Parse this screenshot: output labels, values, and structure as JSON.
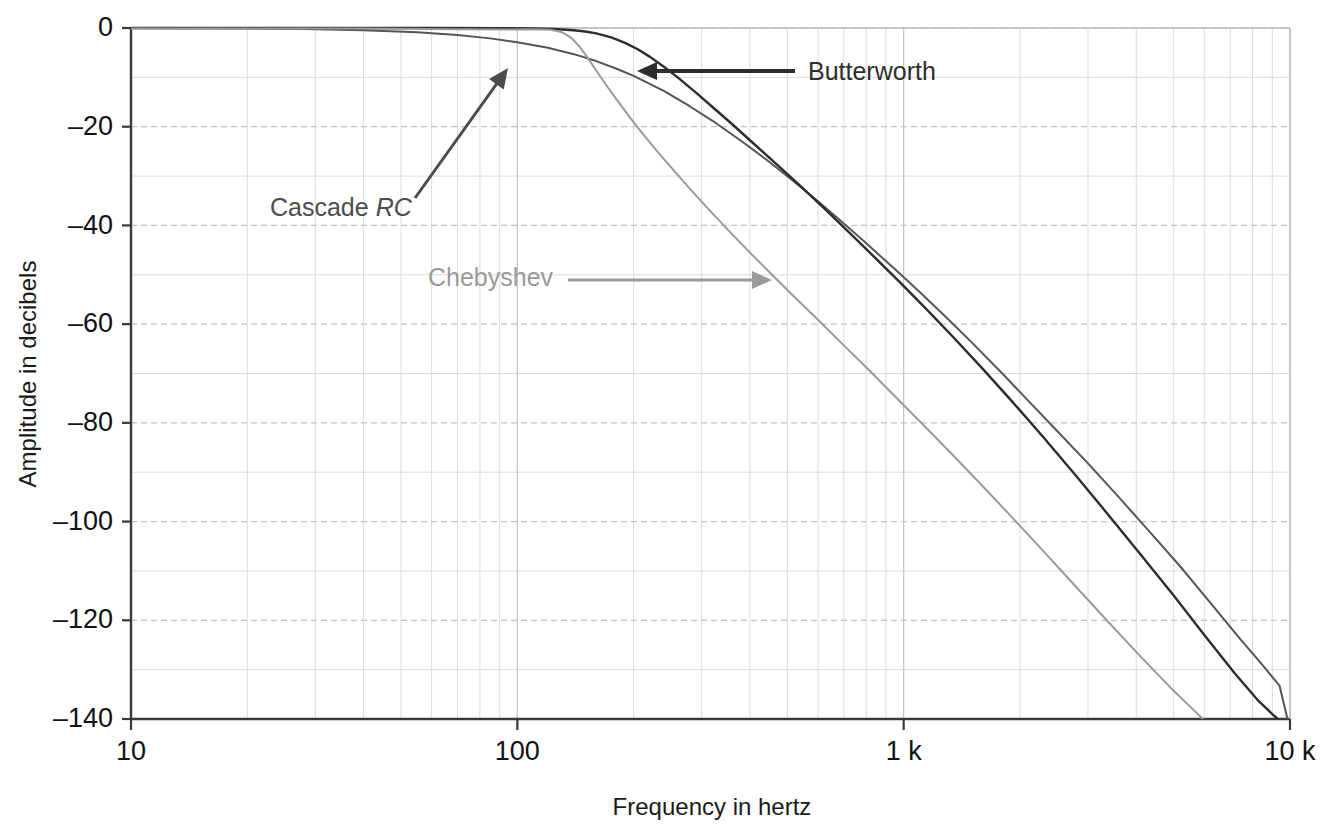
{
  "chart_data": {
    "type": "line",
    "title": "",
    "xlabel": "Frequency in hertz",
    "ylabel": "Amplitude in decibels",
    "xscale": "log",
    "yscale": "linear",
    "xlim": [
      10,
      10000
    ],
    "ylim": [
      -140,
      0
    ],
    "grid": true,
    "grid_minor": true,
    "legend_position": "inline-annotations",
    "x_ticks": [
      {
        "value": 10,
        "label": "10"
      },
      {
        "value": 100,
        "label": "100"
      },
      {
        "value": 1000,
        "label": "1 k"
      },
      {
        "value": 10000,
        "label": "10 k"
      }
    ],
    "y_ticks": [
      {
        "value": 0,
        "label": "0"
      },
      {
        "value": -20,
        "label": "–20"
      },
      {
        "value": -40,
        "label": "–40"
      },
      {
        "value": -60,
        "label": "–60"
      },
      {
        "value": -80,
        "label": "–80"
      },
      {
        "value": -100,
        "label": "–100"
      },
      {
        "value": -120,
        "label": "–120"
      },
      {
        "value": -140,
        "label": "–140"
      }
    ],
    "series": [
      {
        "name": "Cascade RC",
        "color": "#555555",
        "points": [
          [
            10,
            -0.02
          ],
          [
            14,
            -0.05
          ],
          [
            20,
            -0.1
          ],
          [
            28,
            -0.2
          ],
          [
            40,
            -0.45
          ],
          [
            55,
            -0.85
          ],
          [
            70,
            -1.4
          ],
          [
            85,
            -2.1
          ],
          [
            100,
            -2.9
          ],
          [
            120,
            -4.0
          ],
          [
            140,
            -5.3
          ],
          [
            160,
            -6.7
          ],
          [
            180,
            -8.2
          ],
          [
            200,
            -9.7
          ],
          [
            240,
            -12.8
          ],
          [
            280,
            -15.9
          ],
          [
            320,
            -18.8
          ],
          [
            380,
            -22.9
          ],
          [
            440,
            -26.6
          ],
          [
            520,
            -31.1
          ],
          [
            600,
            -35.1
          ],
          [
            700,
            -39.6
          ],
          [
            800,
            -43.6
          ],
          [
            950,
            -48.9
          ],
          [
            1100,
            -53.5
          ],
          [
            1300,
            -58.9
          ],
          [
            1500,
            -63.7
          ],
          [
            1800,
            -70.0
          ],
          [
            2100,
            -75.5
          ],
          [
            2500,
            -81.7
          ],
          [
            3000,
            -88.2
          ],
          [
            3600,
            -95.0
          ],
          [
            4300,
            -101.8
          ],
          [
            5200,
            -109.1
          ],
          [
            6200,
            -116.3
          ],
          [
            7400,
            -123.6
          ],
          [
            8600,
            -129.6
          ],
          [
            9400,
            -133.3
          ],
          [
            9850,
            -140.0
          ]
        ]
      },
      {
        "name": "Butterworth",
        "color": "#2d2d2d",
        "points": [
          [
            10,
            0.0
          ],
          [
            30,
            0.0
          ],
          [
            60,
            0.0
          ],
          [
            90,
            -0.02
          ],
          [
            110,
            -0.08
          ],
          [
            125,
            -0.2
          ],
          [
            140,
            -0.45
          ],
          [
            150,
            -0.7
          ],
          [
            160,
            -1.1
          ],
          [
            175,
            -1.9
          ],
          [
            190,
            -3.0
          ],
          [
            205,
            -4.3
          ],
          [
            220,
            -5.8
          ],
          [
            240,
            -7.9
          ],
          [
            260,
            -10.0
          ],
          [
            290,
            -13.1
          ],
          [
            320,
            -16.0
          ],
          [
            360,
            -19.5
          ],
          [
            410,
            -23.5
          ],
          [
            470,
            -27.7
          ],
          [
            540,
            -32.0
          ],
          [
            620,
            -36.4
          ],
          [
            720,
            -41.3
          ],
          [
            840,
            -46.4
          ],
          [
            980,
            -51.6
          ],
          [
            1150,
            -57.1
          ],
          [
            1350,
            -62.8
          ],
          [
            1600,
            -69.0
          ],
          [
            1900,
            -75.5
          ],
          [
            2300,
            -82.9
          ],
          [
            2800,
            -90.8
          ],
          [
            3400,
            -98.8
          ],
          [
            4100,
            -106.6
          ],
          [
            5000,
            -115.0
          ],
          [
            6000,
            -123.0
          ],
          [
            7200,
            -130.8
          ],
          [
            8300,
            -136.4
          ],
          [
            9000,
            -139.0
          ],
          [
            9300,
            -140.0
          ]
        ]
      },
      {
        "name": "Chebyshev",
        "color": "#9a9a9a",
        "points": [
          [
            10,
            -0.1
          ],
          [
            40,
            -0.12
          ],
          [
            70,
            -0.25
          ],
          [
            95,
            -0.3
          ],
          [
            110,
            -0.25
          ],
          [
            122,
            -0.35
          ],
          [
            130,
            -0.8
          ],
          [
            138,
            -2.0
          ],
          [
            145,
            -3.8
          ],
          [
            152,
            -6.0
          ],
          [
            160,
            -8.6
          ],
          [
            170,
            -11.6
          ],
          [
            182,
            -14.8
          ],
          [
            196,
            -18.2
          ],
          [
            212,
            -21.6
          ],
          [
            232,
            -25.3
          ],
          [
            255,
            -29.0
          ],
          [
            282,
            -32.9
          ],
          [
            315,
            -37.0
          ],
          [
            355,
            -41.3
          ],
          [
            400,
            -45.5
          ],
          [
            455,
            -49.9
          ],
          [
            520,
            -54.4
          ],
          [
            600,
            -59.1
          ],
          [
            700,
            -64.3
          ],
          [
            820,
            -69.6
          ],
          [
            960,
            -75.0
          ],
          [
            1130,
            -80.6
          ],
          [
            1340,
            -86.5
          ],
          [
            1600,
            -92.8
          ],
          [
            1900,
            -99.0
          ],
          [
            2300,
            -106.0
          ],
          [
            2800,
            -113.3
          ],
          [
            3400,
            -120.5
          ],
          [
            4100,
            -127.3
          ],
          [
            4900,
            -133.6
          ],
          [
            5600,
            -138.0
          ],
          [
            5950,
            -140.0
          ]
        ]
      }
    ],
    "annotations": [
      {
        "label": "Butterworth",
        "color": "#2d2d2d",
        "text_x": 808,
        "text_y": 80,
        "arrow_from_x": 795,
        "arrow_from_y": 71,
        "arrow_to_x": 637,
        "arrow_to_y": 71,
        "style": "horizontal-left-arrow"
      },
      {
        "label_plain": "Cascade ",
        "label_italic": "RC",
        "label": "Cascade RC",
        "color": "#4c4c4c",
        "text_x": 270,
        "text_y": 216,
        "arrow_from_x": 415,
        "arrow_from_y": 198,
        "arrow_to_x": 508,
        "arrow_to_y": 68,
        "style": "diagonal-up-right-arrow"
      },
      {
        "label": "Chebyshev",
        "color": "#9a9a9a",
        "text_x": 428,
        "text_y": 286,
        "arrow_from_x": 568,
        "arrow_from_y": 280,
        "arrow_to_x": 772,
        "arrow_to_y": 280,
        "style": "horizontal-right-arrow"
      }
    ]
  },
  "colors": {
    "background": "#ffffff",
    "axis": "#3a3a3a",
    "grid_major": "#c4c4c4",
    "grid_minor": "#dcdcdc",
    "text": "#121212",
    "butterworth": "#2d2d2d",
    "cascade_rc": "#555555",
    "chebyshev": "#9a9a9a"
  }
}
